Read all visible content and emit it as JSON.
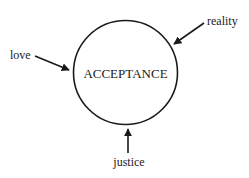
{
  "diagram": {
    "center": {
      "label": "ACCEPTANCE"
    },
    "inputs": [
      {
        "label": "love"
      },
      {
        "label": "reality"
      },
      {
        "label": "justice"
      }
    ]
  },
  "colors": {
    "ink": "#1a1a1a",
    "background": "#ffffff"
  }
}
